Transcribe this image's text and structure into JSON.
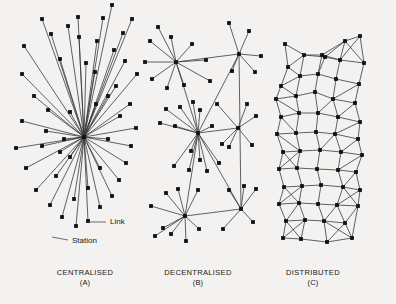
{
  "figure": {
    "background_color": "#f3f2f0",
    "ink_color": "#101012",
    "line_color": "#3a3a3c",
    "width": 396,
    "height": 304
  },
  "annotations": [
    {
      "id": "link",
      "label": "Link",
      "x": 110,
      "y": 222,
      "leader": [
        89,
        222,
        106,
        222
      ]
    },
    {
      "id": "station",
      "label": "Station",
      "x": 72,
      "y": 241,
      "leader": [
        52,
        237,
        68,
        240
      ]
    }
  ],
  "panels": [
    {
      "id": "centralised",
      "title": "CENTRALISED",
      "letter": "(A)",
      "caption_x": 85,
      "caption_y": 268,
      "chart_data": {
        "type": "graph",
        "topology": "star",
        "hubs": [
          [
            84,
            137
          ]
        ],
        "nodes": [
          [
            84,
            137
          ],
          [
            24,
            46
          ],
          [
            42,
            19
          ],
          [
            22,
            74
          ],
          [
            34,
            96
          ],
          [
            51,
            34
          ],
          [
            68,
            26
          ],
          [
            60,
            59
          ],
          [
            48,
            110
          ],
          [
            79,
            37
          ],
          [
            86,
            63
          ],
          [
            78,
            17
          ],
          [
            97,
            41
          ],
          [
            95,
            72
          ],
          [
            103,
            18
          ],
          [
            112,
            5
          ],
          [
            114,
            50
          ],
          [
            123,
            33
          ],
          [
            116,
            86
          ],
          [
            125,
            61
          ],
          [
            132,
            19
          ],
          [
            130,
            104
          ],
          [
            137,
            74
          ],
          [
            120,
            116
          ],
          [
            108,
            96
          ],
          [
            96,
            104
          ],
          [
            22,
            121
          ],
          [
            16,
            148
          ],
          [
            26,
            168
          ],
          [
            36,
            190
          ],
          [
            50,
            205
          ],
          [
            62,
            217
          ],
          [
            76,
            226
          ],
          [
            88,
            221
          ],
          [
            100,
            207
          ],
          [
            112,
            196
          ],
          [
            119,
            180
          ],
          [
            126,
            163
          ],
          [
            131,
            146
          ],
          [
            136,
            128
          ],
          [
            108,
            139
          ],
          [
            70,
            157
          ],
          [
            56,
            176
          ],
          [
            42,
            146
          ],
          [
            64,
            139
          ],
          [
            100,
            168
          ],
          [
            88,
            188
          ],
          [
            74,
            199
          ],
          [
            60,
            152
          ],
          [
            46,
            131
          ],
          [
            70,
            112
          ]
        ],
        "edges_description": "every node connects only to the single hub"
      }
    },
    {
      "id": "decentralised",
      "title": "DECENTRALISED",
      "letter": "(B)",
      "caption_x": 198,
      "caption_y": 268,
      "chart_data": {
        "type": "graph",
        "topology": "hub-and-spoke clusters linked by backbone",
        "hubs": [
          [
            176,
            62
          ],
          [
            239,
            54
          ],
          [
            198,
            133
          ],
          [
            238,
            128
          ],
          [
            185,
            216
          ],
          [
            241,
            209
          ]
        ],
        "nodes": [
          [
            176,
            62
          ],
          [
            239,
            54
          ],
          [
            198,
            133
          ],
          [
            238,
            128
          ],
          [
            185,
            216
          ],
          [
            241,
            209
          ],
          [
            158,
            27
          ],
          [
            171,
            37
          ],
          [
            150,
            41
          ],
          [
            145,
            62
          ],
          [
            152,
            79
          ],
          [
            167,
            88
          ],
          [
            184,
            85
          ],
          [
            192,
            44
          ],
          [
            206,
            60
          ],
          [
            210,
            81
          ],
          [
            229,
            23
          ],
          [
            249,
            31
          ],
          [
            255,
            72
          ],
          [
            261,
            56
          ],
          [
            232,
            71
          ],
          [
            217,
            104
          ],
          [
            180,
            107
          ],
          [
            166,
            109
          ],
          [
            160,
            123
          ],
          [
            175,
            126
          ],
          [
            212,
            126
          ],
          [
            222,
            144
          ],
          [
            193,
            102
          ],
          [
            200,
            110
          ],
          [
            247,
            104
          ],
          [
            256,
            116
          ],
          [
            252,
            145
          ],
          [
            229,
            147
          ],
          [
            191,
            151
          ],
          [
            200,
            160
          ],
          [
            207,
            171
          ],
          [
            174,
            166
          ],
          [
            189,
            170
          ],
          [
            219,
            163
          ],
          [
            166,
            193
          ],
          [
            178,
            189
          ],
          [
            198,
            190
          ],
          [
            171,
            234
          ],
          [
            199,
            229
          ],
          [
            163,
            228
          ],
          [
            186,
            241
          ],
          [
            151,
            206
          ],
          [
            155,
            236
          ],
          [
            229,
            190
          ],
          [
            256,
            189
          ],
          [
            223,
            229
          ],
          [
            253,
            222
          ],
          [
            244,
            186
          ]
        ],
        "edges_description": "local spokes to each regional hub plus inter-hub backbone links"
      }
    },
    {
      "id": "distributed",
      "title": "DISTRIBUTED",
      "letter": "(C)",
      "caption_x": 313,
      "caption_y": 268,
      "chart_data": {
        "type": "graph",
        "topology": "irregular triangulated mesh / lattice",
        "nodes": [
          [
            285,
            44
          ],
          [
            325,
            57
          ],
          [
            345,
            41
          ],
          [
            360,
            36
          ],
          [
            288,
            67
          ],
          [
            304,
            55
          ],
          [
            322,
            55
          ],
          [
            340,
            60
          ],
          [
            364,
            63
          ],
          [
            281,
            86
          ],
          [
            300,
            76
          ],
          [
            318,
            74
          ],
          [
            336,
            79
          ],
          [
            359,
            84
          ],
          [
            276,
            99
          ],
          [
            296,
            96
          ],
          [
            315,
            92
          ],
          [
            333,
            99
          ],
          [
            355,
            103
          ],
          [
            281,
            117
          ],
          [
            299,
            113
          ],
          [
            318,
            113
          ],
          [
            338,
            117
          ],
          [
            360,
            122
          ],
          [
            277,
            134
          ],
          [
            296,
            133
          ],
          [
            316,
            132
          ],
          [
            335,
            134
          ],
          [
            358,
            139
          ],
          [
            283,
            152
          ],
          [
            300,
            151
          ],
          [
            320,
            150
          ],
          [
            341,
            152
          ],
          [
            362,
            155
          ],
          [
            279,
            169
          ],
          [
            297,
            168
          ],
          [
            317,
            169
          ],
          [
            338,
            170
          ],
          [
            356,
            172
          ],
          [
            284,
            187
          ],
          [
            302,
            186
          ],
          [
            321,
            185
          ],
          [
            343,
            187
          ],
          [
            360,
            190
          ],
          [
            279,
            204
          ],
          [
            299,
            203
          ],
          [
            318,
            204
          ],
          [
            337,
            205
          ],
          [
            358,
            206
          ],
          [
            286,
            221
          ],
          [
            305,
            220
          ],
          [
            324,
            221
          ],
          [
            345,
            223
          ],
          [
            352,
            238
          ],
          [
            283,
            238
          ],
          [
            301,
            239
          ],
          [
            327,
            242
          ]
        ],
        "edges_description": "each node links to 3-5 nearest neighbours forming a redundant mesh"
      }
    }
  ]
}
